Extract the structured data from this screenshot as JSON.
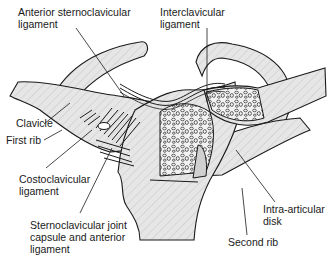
{
  "figure": {
    "labels": {
      "anterior_sternoclavicular_ligament": [
        "Anterior sternoclavicular",
        "ligament"
      ],
      "interclavicular_ligament": [
        "Interclavicular",
        "ligament"
      ],
      "clavicle": [
        "Clavicle"
      ],
      "first_rib": [
        "First rib"
      ],
      "costoclavicular_ligament": [
        "Costoclavicular",
        "ligament"
      ],
      "sternoclavicular_joint_capsule": [
        "Sternoclavicular joint",
        "capsule and anterior",
        "ligament"
      ],
      "intra_articular_disk": [
        "Intra-articular",
        "disk"
      ],
      "second_rib": [
        "Second rib"
      ]
    },
    "colors": {
      "bone_fill": "#e4e4e4",
      "outline": "#1a1a1a",
      "background": "#ffffff"
    }
  }
}
